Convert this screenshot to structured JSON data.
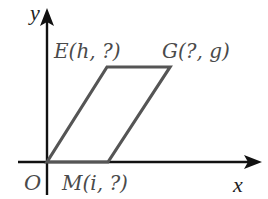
{
  "diagram": {
    "type": "coordinate-parallelogram",
    "axes": {
      "x_label": "x",
      "y_label": "y",
      "origin_label": "O"
    },
    "points": [
      {
        "id": "O",
        "label": "O",
        "x": 47,
        "y": 162
      },
      {
        "id": "E",
        "label": "E(h, ?)",
        "x": 107,
        "y": 67
      },
      {
        "id": "G",
        "label": "G(?, g)",
        "x": 170,
        "y": 67
      },
      {
        "id": "M",
        "label": "M(i, ?)",
        "x": 108,
        "y": 162
      }
    ],
    "shape": {
      "name": "parallelogram",
      "vertices": [
        "O",
        "E",
        "G",
        "M"
      ],
      "stroke_color": "#555555"
    },
    "colors": {
      "axis": "#111111",
      "shape": "#555555",
      "label": "#4a4a4a",
      "background": "#ffffff"
    }
  }
}
